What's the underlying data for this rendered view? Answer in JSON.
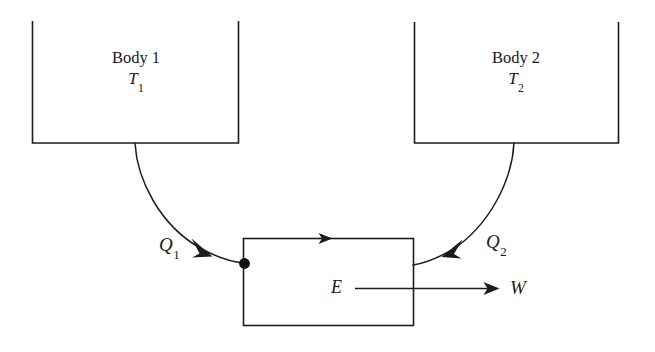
{
  "figure": {
    "type": "thermodynamic-heat-engine-diagram",
    "background_color": "#ffffff",
    "line_color": "#1c1c1c"
  },
  "bodies": [
    {
      "id": "body-1",
      "name": "Body 1",
      "temperature_symbol": "T",
      "temperature_subscript": "1"
    },
    {
      "id": "body-2",
      "name": "Body 2",
      "temperature_symbol": "T",
      "temperature_subscript": "2"
    }
  ],
  "heat_flows": [
    {
      "id": "q1",
      "symbol": "Q",
      "subscript": "1",
      "from": "Body 1",
      "to": "E",
      "direction": "into-engine"
    },
    {
      "id": "q2",
      "symbol": "Q",
      "subscript": "2",
      "from": "Body 2",
      "to": "E",
      "direction": "into-engine"
    }
  ],
  "engine": {
    "id": "engine",
    "symbol": "E"
  },
  "work": {
    "id": "work",
    "symbol": "W",
    "direction": "out-of-engine"
  }
}
